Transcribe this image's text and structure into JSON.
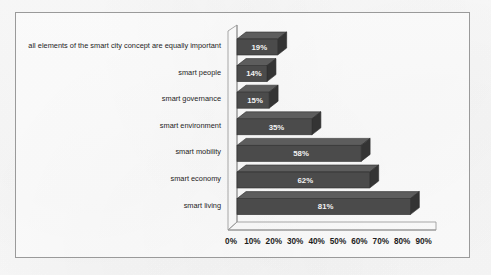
{
  "chart_data": {
    "type": "bar",
    "orientation": "horizontal",
    "style": "3d",
    "title": "",
    "subtitle": "",
    "xlabel": "",
    "ylabel": "",
    "xlim": [
      0,
      90
    ],
    "grid": false,
    "legend": false,
    "axis_tick_labels": [
      "0%",
      "10%",
      "20%",
      "30%",
      "40%",
      "50%",
      "60%",
      "70%",
      "80%",
      "90%"
    ],
    "axis_tick_values": [
      0,
      10,
      20,
      30,
      40,
      50,
      60,
      70,
      80,
      90
    ],
    "categories": [
      "smart living",
      "smart economy",
      "smart mobility",
      "smart environment",
      "smart governance",
      "smart people",
      "all elements of the smart city concept are equally important"
    ],
    "values": [
      81,
      62,
      58,
      35,
      15,
      14,
      19
    ],
    "data_labels": [
      "81%",
      "62%",
      "58%",
      "35%",
      "15%",
      "14%",
      "19%"
    ],
    "series": [
      {
        "name": "share of respondents",
        "values": [
          81,
          62,
          58,
          35,
          15,
          14,
          19
        ]
      }
    ],
    "bar_color": "#4b4b4b",
    "bar_top_color": "#5d5d5d",
    "bar_side_color": "#343434",
    "value_label_color": "#f2f2f2",
    "axis_color": "#8c8c8c",
    "frame_color": "#9a9a9a",
    "background_color": "#fdfdfd"
  },
  "frame": {
    "border_color": "#9a9a9a"
  }
}
